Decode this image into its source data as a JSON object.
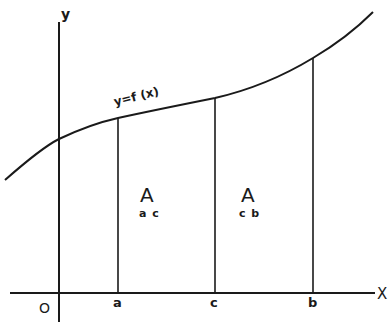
{
  "diagram": {
    "type": "definite-integral-area-split",
    "axes": {
      "y_label": "y",
      "x_label": "X",
      "origin_label": "O"
    },
    "curve": {
      "label": "y=f (x)"
    },
    "points": [
      {
        "label": "a"
      },
      {
        "label": "c"
      },
      {
        "label": "b"
      }
    ],
    "regions": [
      {
        "main": "A",
        "sub": "a c"
      },
      {
        "main": "A",
        "sub": "c b"
      }
    ],
    "colors": {
      "ink": "#1a1a1a",
      "background": "#ffffff"
    }
  }
}
